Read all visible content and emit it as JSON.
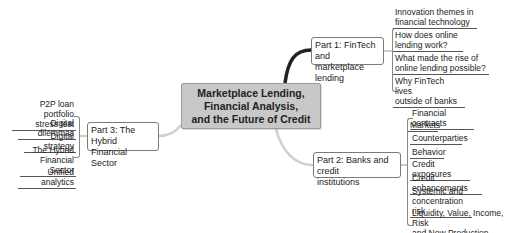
{
  "central": {
    "title": "Marketplace Lending,\nFinancial Analysis,\nand the Future of Credit"
  },
  "parts": [
    {
      "label": "Part 1: FinTech and\nmarketplace lending",
      "children": [
        "Innovation themes in\nfinancial technology",
        "How does online\nlending work?",
        "What made the rise of\nonline lending possible?",
        "Why FinTech lives\noutside of banks"
      ]
    },
    {
      "label": "Part 2: Banks and credit\ninstitutions",
      "children": [
        "Financial contracts",
        "Markets",
        "Counterparties",
        "Behavior",
        "Credit exposures",
        "Credit enhancements",
        "Systemic and\nconcentration risk",
        "Liquidity, Value, Income, Risk\nand New Production"
      ]
    },
    {
      "label": "Part 3: The Hybrid\nFinancial Sector",
      "children": [
        "P2P loan portfolio\nstress test",
        "Digital dilemmas",
        "Digital strategy",
        "The Hybrid\nFinancial Sector",
        "Unified analytics"
      ]
    }
  ],
  "colors": {
    "central_fill": "#c8c8c8",
    "connector": "#222222",
    "connector_light": "#cfcfcf"
  }
}
